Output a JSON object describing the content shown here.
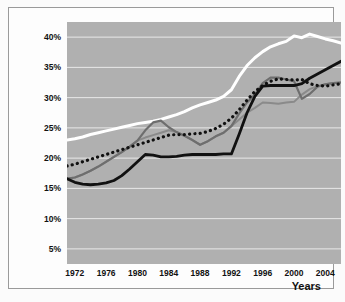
{
  "chart": {
    "ylabel": "Maximum annual income swings",
    "xlabel": "Years"
  },
  "chart_data": {
    "type": "line",
    "title": "",
    "subtitle": "",
    "xlabel": "Years",
    "ylabel": "Maximum annual income swings",
    "xlim": [
      1971,
      2006
    ],
    "ylim": [
      2.5,
      42.5
    ],
    "yticks": [
      5,
      10,
      15,
      20,
      25,
      30,
      35,
      40
    ],
    "ytick_labels": [
      "5%",
      "10%",
      "15%",
      "20%",
      "25%",
      "30%",
      "35%",
      "40%"
    ],
    "xticks": [
      1972,
      1976,
      1980,
      1984,
      1988,
      1992,
      1996,
      2000,
      2004
    ],
    "xtick_labels": [
      "1972",
      "1976",
      "1980",
      "1984",
      "1988",
      "1992",
      "1996",
      "2000",
      "2004"
    ],
    "grid": true,
    "grid_color": "#e8e8e8",
    "plot_background": "#b0b0b0",
    "legend": "none",
    "legend_position": "none",
    "x": [
      1971,
      1972,
      1973,
      1974,
      1975,
      1976,
      1977,
      1978,
      1979,
      1980,
      1981,
      1982,
      1983,
      1984,
      1985,
      1986,
      1987,
      1988,
      1989,
      1990,
      1991,
      1992,
      1993,
      1994,
      1995,
      1996,
      1997,
      1998,
      1999,
      2000,
      2001,
      2002,
      2003,
      2004,
      2005,
      2006
    ],
    "series": [
      {
        "name": "white-line",
        "color": "#ffffff",
        "style": "solid",
        "width": 3.0,
        "values": [
          23.0,
          23.2,
          23.5,
          23.9,
          24.2,
          24.5,
          24.8,
          25.1,
          25.4,
          25.7,
          25.9,
          26.1,
          26.4,
          26.8,
          27.2,
          27.7,
          28.3,
          28.8,
          29.2,
          29.6,
          30.2,
          31.3,
          33.5,
          35.3,
          36.6,
          37.6,
          38.4,
          38.9,
          39.3,
          40.2,
          39.9,
          40.5,
          40.1,
          39.7,
          39.4,
          39.0
        ]
      },
      {
        "name": "dotted-black-line",
        "color": "#111111",
        "style": "dotted",
        "width": 3.2,
        "values": [
          18.7,
          19.0,
          19.4,
          19.8,
          20.2,
          20.6,
          21.0,
          21.4,
          21.8,
          22.2,
          22.6,
          23.0,
          23.4,
          23.8,
          23.9,
          23.9,
          24.0,
          24.1,
          24.4,
          24.9,
          25.6,
          26.6,
          28.0,
          29.6,
          31.0,
          32.0,
          32.7,
          33.1,
          33.0,
          32.9,
          33.0,
          32.3,
          32.0,
          31.9,
          32.1,
          32.3
        ]
      },
      {
        "name": "gray-line",
        "color": "#6e6e6e",
        "style": "solid",
        "width": 2.2,
        "values": [
          16.6,
          16.8,
          17.3,
          17.9,
          18.6,
          19.4,
          20.2,
          21.0,
          21.9,
          22.9,
          24.6,
          25.9,
          26.2,
          25.1,
          24.3,
          23.7,
          23.0,
          22.2,
          22.8,
          23.6,
          24.2,
          25.3,
          27.4,
          29.2,
          30.5,
          32.4,
          33.3,
          33.3,
          33.0,
          32.7,
          29.8,
          30.6,
          31.8,
          32.2,
          32.4,
          32.5
        ]
      },
      {
        "name": "solid-black-line",
        "color": "#111111",
        "style": "solid",
        "width": 2.8,
        "values": [
          16.6,
          16.0,
          15.7,
          15.6,
          15.7,
          15.9,
          16.3,
          17.1,
          18.2,
          19.4,
          20.6,
          20.5,
          20.2,
          20.2,
          20.3,
          20.5,
          20.6,
          20.6,
          20.6,
          20.6,
          20.7,
          20.7,
          24.0,
          27.5,
          30.2,
          31.9,
          32.0,
          32.0,
          32.0,
          32.0,
          32.3,
          33.2,
          33.9,
          34.6,
          35.3,
          36.0
        ]
      },
      {
        "name": "secondary-gray-line",
        "color": "#8a8a8a",
        "style": "solid",
        "width": 2.0,
        "values": [
          16.6,
          16.8,
          17.3,
          17.9,
          18.6,
          19.4,
          20.2,
          21.0,
          21.9,
          22.9,
          23.4,
          23.8,
          24.2,
          24.6,
          24.3,
          23.7,
          23.0,
          22.2,
          22.8,
          23.6,
          24.2,
          25.3,
          26.4,
          27.5,
          28.3,
          29.2,
          29.1,
          29.0,
          29.2,
          29.3,
          30.5,
          31.4,
          31.9,
          32.2,
          32.4,
          32.5
        ]
      }
    ]
  }
}
